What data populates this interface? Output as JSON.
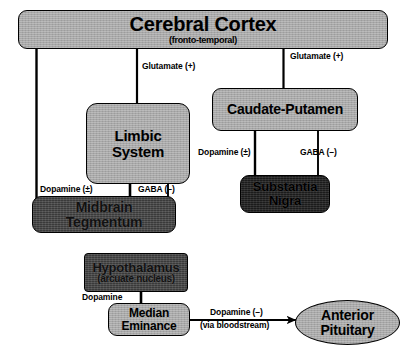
{
  "diagram": {
    "colors": {
      "light_box": "#a8a8a8",
      "dark_box": "#3a3a3a",
      "darker_box": "#1b1b1b",
      "stroke": "#000000",
      "background": "#ffffff"
    },
    "nodes": [
      {
        "id": "cerebral_cortex",
        "title": "Cerebral Cortex",
        "subtitle": "(fronto-temporal)",
        "shape": "rounded-rect",
        "fill": "light"
      },
      {
        "id": "limbic_system",
        "title_line1": "Limbic",
        "title_line2": "System",
        "shape": "rounded-rect",
        "fill": "light"
      },
      {
        "id": "caudate_putamen",
        "title": "Caudate-Putamen",
        "shape": "rounded-rect",
        "fill": "light"
      },
      {
        "id": "midbrain_tegmentum",
        "title_line1": "Midbrain",
        "title_line2": "Tegmentum",
        "shape": "rounded-rect",
        "fill": "dark"
      },
      {
        "id": "substantia_nigra",
        "title_line1": "Substantia",
        "title_line2": "Nigra",
        "shape": "rounded-rect",
        "fill": "darker"
      },
      {
        "id": "hypothalamus",
        "title": "Hypothalamus",
        "subtitle": "(arcuate nucleus)",
        "shape": "rect",
        "fill": "dark"
      },
      {
        "id": "median_eminance",
        "title_line1": "Median",
        "title_line2": "Eminance",
        "shape": "rounded-rect",
        "fill": "light"
      },
      {
        "id": "anterior_pituitary",
        "title_line1": "Anterior",
        "title_line2": "Pituitary",
        "shape": "ellipse",
        "fill": "light"
      }
    ],
    "edge_labels": {
      "glutamate_cortex_to_limbic": "Glutamate (+)",
      "glutamate_cortex_to_caudate": "Glutamate (+)",
      "dopamine_midbrain_to_limbic": "Dopamine (±)",
      "gaba_limbic_to_midbrain": "GABA (–)",
      "dopamine_nigra_to_caudate": "Dopamine (±)",
      "gaba_caudate_to_nigra": "GABA (–)",
      "dopamine_hypothalamus_to_eminance": "Dopamine",
      "dopamine_eminance_to_pituitary_line1": "Dopamine (–)",
      "dopamine_eminance_to_pituitary_line2": "(via bloodstream)"
    }
  }
}
